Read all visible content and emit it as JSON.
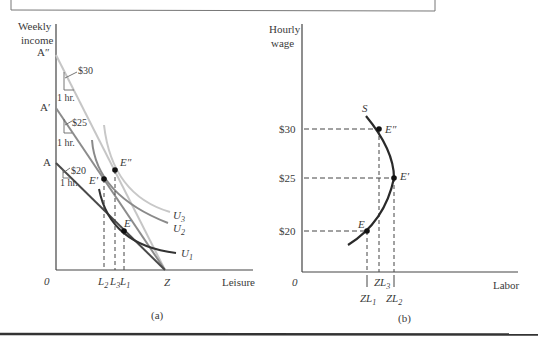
{
  "panel_a": {
    "y_axis_label_line1": "Weekly",
    "y_axis_label_line2": "income",
    "x_axis_label": "Leisure",
    "origin": "0",
    "caption": "(a)",
    "intercepts": {
      "a_double_prime": "A″",
      "a_prime": "A′",
      "a": "A",
      "z": "Z"
    },
    "wage_labels": {
      "w30": "$30",
      "w25": "$25",
      "w20": "$20"
    },
    "hour_labels": {
      "h1": "1 hr.",
      "h2": "1 hr.",
      "h3": "1 hr."
    },
    "points": {
      "e_double_prime": "E″",
      "e_prime": "E′",
      "e": "E"
    },
    "leisure_ticks": {
      "l2": "L",
      "l2_sub": "2",
      "l3": "L",
      "l3_sub": "3",
      "l1": "L",
      "l1_sub": "1"
    },
    "curves": {
      "u3": "U",
      "u3_sub": "3",
      "u2": "U",
      "u2_sub": "2",
      "u1": "U",
      "u1_sub": "1"
    }
  },
  "panel_b": {
    "y_axis_label_line1": "Hourly",
    "y_axis_label_line2": "wage",
    "x_axis_label": "Labor",
    "origin": "0",
    "caption": "(b)",
    "curve_label": "S",
    "wage_ticks": {
      "w30": "$30",
      "w25": "$25",
      "w20": "$20"
    },
    "points": {
      "e_double_prime": "E″",
      "e_prime": "E′",
      "e": "E"
    },
    "labor_ticks": {
      "zl1": "ZL",
      "zl1_sub": "1",
      "zl3": "ZL",
      "zl3_sub": "3",
      "zl2": "ZL",
      "zl2_sub": "2"
    }
  },
  "colors": {
    "budget_30": "#c4c4c4",
    "budget_25": "#8c8c8c",
    "budget_20": "#4a4a4a",
    "u3": "#c8c8c8",
    "u2": "#8a8a8a",
    "u1": "#3a3a3a",
    "axis": "#444444",
    "supply_curve": "#2a2a2a"
  }
}
